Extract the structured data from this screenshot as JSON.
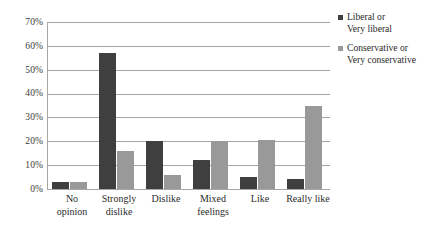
{
  "chart_data": {
    "type": "bar",
    "title": "",
    "xlabel": "",
    "ylabel": "",
    "ylim": [
      0,
      70
    ],
    "ytick_labels": [
      "70%",
      "60%",
      "50%",
      "40%",
      "30%",
      "20%",
      "10%",
      "0%"
    ],
    "ytick_values": [
      70,
      60,
      50,
      40,
      30,
      20,
      10,
      0
    ],
    "grid": true,
    "legend_position": "right",
    "categories": [
      "No opinion",
      "Strongly dislike",
      "Dislike",
      "Mixed feelings",
      "Like",
      "Really like"
    ],
    "category_lines": [
      [
        "No",
        "opinion"
      ],
      [
        "Strongly",
        "dislike"
      ],
      [
        "Dislike"
      ],
      [
        "Mixed",
        "feelings"
      ],
      [
        "Like"
      ],
      [
        "Really like"
      ]
    ],
    "series": [
      {
        "name": "Liberal or Very liberal",
        "name_lines": [
          "Liberal or",
          "Very liberal"
        ],
        "color": "#3f3f3f",
        "values": [
          3,
          57,
          20,
          12,
          5,
          4
        ]
      },
      {
        "name": "Conservative or Very conservative",
        "name_lines": [
          "Conservative or",
          "Very conservative"
        ],
        "color": "#999999",
        "values": [
          3,
          16,
          6,
          20,
          20.5,
          35
        ]
      }
    ]
  },
  "colors": {
    "series0": "#3f3f3f",
    "series1": "#999999",
    "gridline": "#a6a6a6",
    "background": "#ffffff",
    "text": "#2b2b2b"
  }
}
